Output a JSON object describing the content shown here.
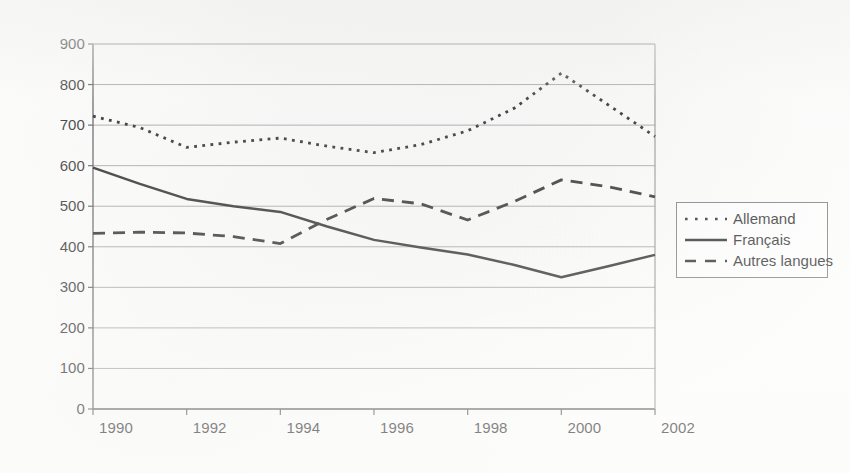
{
  "chart_data": {
    "type": "line",
    "title": "",
    "subtitle": "",
    "xlabel": "",
    "ylabel": "",
    "ylim": [
      0,
      900
    ],
    "ytick_step": 100,
    "yticks": [
      "900",
      "800",
      "700",
      "600",
      "500",
      "400",
      "300",
      "200",
      "100",
      "0"
    ],
    "grid": true,
    "grid_axis": "y",
    "legend_position": "right",
    "x": [
      1990,
      1991,
      1992,
      1993,
      1994,
      1995,
      1996,
      1997,
      1998,
      1999,
      2000,
      2001,
      2002
    ],
    "categories": [
      "1990",
      "1991",
      "1992",
      "1993",
      "1994",
      "1995",
      "1996",
      "1997",
      "1998",
      "1999",
      "2000",
      "2001",
      "2002"
    ],
    "xtick_labels": [
      "1990",
      "1992",
      "1994",
      "1996",
      "1998",
      "2000",
      "2002"
    ],
    "xtick_indices": [
      0,
      2,
      4,
      6,
      8,
      10,
      12
    ],
    "series": [
      {
        "name": "Allemand",
        "style": "dotted",
        "color": "#111111",
        "values": [
          722,
          694,
          645,
          658,
          668,
          648,
          632,
          652,
          686,
          742,
          828,
          750,
          672
        ]
      },
      {
        "name": "Français",
        "style": "solid",
        "color": "#111111",
        "values": [
          595,
          555,
          518,
          500,
          486,
          450,
          417,
          398,
          381,
          355,
          325,
          352,
          380
        ]
      },
      {
        "name": "Autres langues",
        "style": "dashed",
        "color": "#111111",
        "values": [
          433,
          436,
          434,
          425,
          408,
          468,
          519,
          506,
          466,
          512,
          565,
          548,
          523
        ]
      }
    ]
  },
  "legend": {
    "entries": [
      {
        "label": "Allemand",
        "swatch": "dotted-line-swatch"
      },
      {
        "label": "Français",
        "swatch": "solid-line-swatch"
      },
      {
        "label": "Autres langues",
        "swatch": "dashed-line-swatch"
      }
    ]
  },
  "plot_area": {
    "left": 93,
    "top": 44,
    "right": 655,
    "bottom": 409
  }
}
